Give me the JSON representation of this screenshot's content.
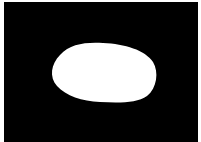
{
  "image": {
    "background_color": "#000000",
    "border_color": "#ffffff",
    "shape": {
      "kind": "ellipse-blob",
      "fill": "#ffffff"
    }
  }
}
